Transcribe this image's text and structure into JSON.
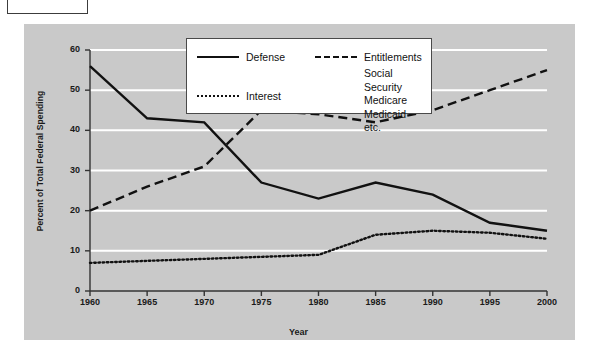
{
  "chart_data": {
    "type": "line",
    "title": "",
    "xlabel": "Year",
    "ylabel": "Percent of Total Federal Spending",
    "x": [
      1960,
      1965,
      1970,
      1975,
      1980,
      1985,
      1990,
      1995,
      2000
    ],
    "xticks": [
      "1960",
      "1965",
      "1970",
      "1975",
      "1980",
      "1985",
      "1990",
      "1995",
      "2000"
    ],
    "yticks": [
      "0",
      "10",
      "20",
      "30",
      "40",
      "50",
      "60"
    ],
    "xlim": [
      1960,
      2000
    ],
    "ylim": [
      0,
      60
    ],
    "grid": "horizontal-white",
    "legend_position": "top-center",
    "series": [
      {
        "name": "Defense",
        "style": "solid",
        "color": "#111111",
        "values": [
          56,
          43,
          42,
          27,
          23,
          27,
          24,
          17,
          15
        ]
      },
      {
        "name": "Entitlements",
        "style": "dashed",
        "color": "#111111",
        "sublabels": [
          "Social Security",
          "Medicare",
          "Medicaid",
          "etc."
        ],
        "values": [
          20,
          26,
          31,
          45,
          44,
          42,
          45,
          50,
          55
        ]
      },
      {
        "name": "Interest",
        "style": "dotted",
        "color": "#111111",
        "values": [
          7,
          7.5,
          8,
          8.5,
          9,
          14,
          15,
          14.5,
          13
        ]
      }
    ]
  },
  "legend": {
    "defense_label": "Defense",
    "interest_label": "Interest",
    "entitlements_label": "Entitlements",
    "entitlements_sub_1": "Social Security",
    "entitlements_sub_2": "Medicare",
    "entitlements_sub_3": "Medicaid",
    "entitlements_sub_4": "etc."
  },
  "caption_box": {
    "text": ""
  },
  "colors": {
    "panel_background": "#c9c9c9",
    "page_background": "#ffffff",
    "line": "#111111",
    "gridline": "#ffffff",
    "axis": "#333333"
  }
}
